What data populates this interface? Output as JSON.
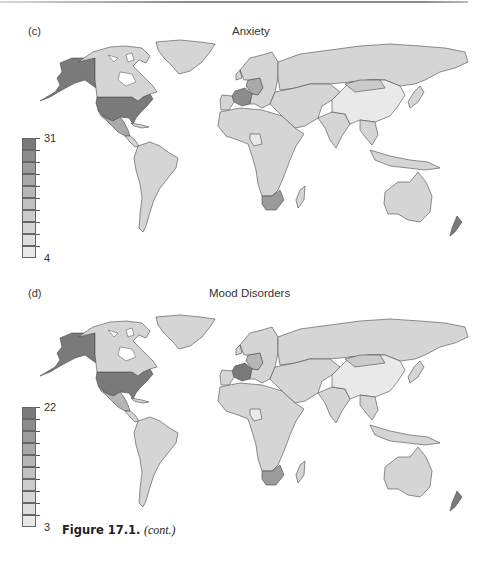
{
  "figure": {
    "caption_number": "Figure 17.1.",
    "caption_suffix": "(cont.)"
  },
  "chart_data": [
    {
      "type": "heatmap",
      "subtype": "choropleth-world-map",
      "panel_label": "(c)",
      "title": "Anxiety",
      "legend": {
        "min_label": "4",
        "max_label": "31",
        "range": [
          4,
          31
        ],
        "bins": 10,
        "placement": "left"
      },
      "colors": [
        "#e9e9e9",
        "#dedede",
        "#d5d5d5",
        "#cbcbcb",
        "#c1c1c1",
        "#b6b6b6",
        "#a9a9a9",
        "#9b9b9b",
        "#8c8c8c",
        "#7a7a7a"
      ],
      "regions": [
        {
          "name": "Alaska (USA)",
          "bin": 9
        },
        {
          "name": "USA",
          "bin": 9
        },
        {
          "name": "Canada",
          "bin": 2
        },
        {
          "name": "Greenland",
          "bin": 2
        },
        {
          "name": "Mexico",
          "bin": 6
        },
        {
          "name": "Central America & Caribbean",
          "bin": 2
        },
        {
          "name": "South America",
          "bin": 2
        },
        {
          "name": "France",
          "bin": 8
        },
        {
          "name": "Germany",
          "bin": 6
        },
        {
          "name": "Europe (other)",
          "bin": 2
        },
        {
          "name": "Russia",
          "bin": 2
        },
        {
          "name": "Middle East & Central Asia",
          "bin": 2
        },
        {
          "name": "India & South Asia",
          "bin": 2
        },
        {
          "name": "China",
          "bin": 0
        },
        {
          "name": "Mongolia",
          "bin": 3
        },
        {
          "name": "Southeast Asia",
          "bin": 2
        },
        {
          "name": "Japan",
          "bin": 2
        },
        {
          "name": "Africa (other)",
          "bin": 2
        },
        {
          "name": "Nigeria",
          "bin": 0
        },
        {
          "name": "South Africa",
          "bin": 7
        },
        {
          "name": "Madagascar",
          "bin": 2
        },
        {
          "name": "Australia",
          "bin": 2
        },
        {
          "name": "New Zealand",
          "bin": 9
        },
        {
          "name": "Indonesia & Pacific",
          "bin": 2
        }
      ]
    },
    {
      "type": "heatmap",
      "subtype": "choropleth-world-map",
      "panel_label": "(d)",
      "title": "Mood Disorders",
      "legend": {
        "min_label": "3",
        "max_label": "22",
        "range": [
          3,
          22
        ],
        "bins": 10,
        "placement": "left"
      },
      "colors": [
        "#e9e9e9",
        "#dedede",
        "#d5d5d5",
        "#cbcbcb",
        "#c1c1c1",
        "#b6b6b6",
        "#a9a9a9",
        "#9b9b9b",
        "#8c8c8c",
        "#7a7a7a"
      ],
      "regions": [
        {
          "name": "Alaska (USA)",
          "bin": 9
        },
        {
          "name": "USA",
          "bin": 9
        },
        {
          "name": "Canada",
          "bin": 2
        },
        {
          "name": "Greenland",
          "bin": 2
        },
        {
          "name": "Mexico",
          "bin": 5
        },
        {
          "name": "Central America & Caribbean",
          "bin": 2
        },
        {
          "name": "South America",
          "bin": 2
        },
        {
          "name": "France",
          "bin": 9
        },
        {
          "name": "Germany",
          "bin": 5
        },
        {
          "name": "Europe (other)",
          "bin": 2
        },
        {
          "name": "Russia",
          "bin": 2
        },
        {
          "name": "Middle East & Central Asia",
          "bin": 2
        },
        {
          "name": "India & South Asia",
          "bin": 2
        },
        {
          "name": "China",
          "bin": 0
        },
        {
          "name": "Mongolia",
          "bin": 3
        },
        {
          "name": "Southeast Asia",
          "bin": 2
        },
        {
          "name": "Japan",
          "bin": 2
        },
        {
          "name": "Africa (other)",
          "bin": 2
        },
        {
          "name": "Nigeria",
          "bin": 0
        },
        {
          "name": "South Africa",
          "bin": 7
        },
        {
          "name": "Madagascar",
          "bin": 2
        },
        {
          "name": "Australia",
          "bin": 2
        },
        {
          "name": "New Zealand",
          "bin": 9
        },
        {
          "name": "Indonesia & Pacific",
          "bin": 2
        }
      ]
    }
  ]
}
